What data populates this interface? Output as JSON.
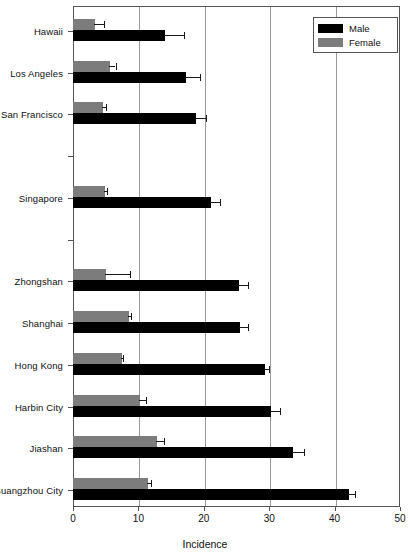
{
  "chart_data": {
    "type": "bar",
    "orientation": "horizontal",
    "title": "",
    "xlabel": "Incidence",
    "ylabel": "",
    "xlim": [
      0,
      50
    ],
    "xticks": [
      0,
      10,
      20,
      30,
      40,
      50
    ],
    "xtick_labels": [
      "0",
      "10",
      "20",
      "30",
      "40",
      "50"
    ],
    "grid": "vertical",
    "legend_position": "top-right",
    "legend": [
      "Male",
      "Female"
    ],
    "categories": [
      "Hawaii",
      "Los Angeles",
      "San Francisco",
      "",
      "Singapore",
      "",
      "Zhongshan",
      "Shanghai",
      "Hong Kong",
      "Harbin City",
      "Jiashan",
      "Guangzhou City"
    ],
    "series": [
      {
        "name": "Male",
        "color": "#000000",
        "values": [
          14.0,
          17.3,
          18.8,
          null,
          21.1,
          null,
          25.4,
          25.6,
          29.3,
          30.2,
          33.6,
          42.2
        ],
        "errors": [
          3.0,
          2.1,
          1.6,
          null,
          1.4,
          null,
          1.4,
          1.2,
          0.7,
          1.4,
          1.7,
          0.9
        ]
      },
      {
        "name": "Female",
        "color": "#7c7c7c",
        "values": [
          3.4,
          5.6,
          4.6,
          null,
          4.9,
          null,
          5.0,
          8.5,
          7.5,
          10.3,
          12.8,
          11.4
        ],
        "errors": [
          1.3,
          0.9,
          0.4,
          null,
          0.3,
          null,
          3.7,
          0.3,
          0.2,
          0.8,
          1.1,
          0.5
        ]
      }
    ]
  },
  "axis": {
    "x_title": "Incidence"
  }
}
